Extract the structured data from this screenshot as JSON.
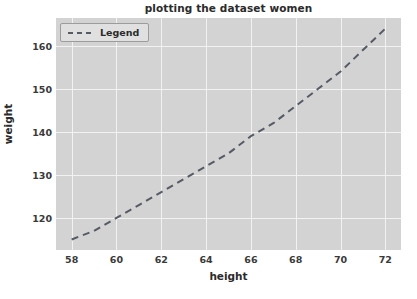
{
  "chart_data": {
    "type": "line",
    "title": "plotting the dataset women",
    "xlabel": "height",
    "ylabel": "weight",
    "x": [
      58,
      59,
      60,
      61,
      62,
      63,
      64,
      65,
      66,
      67,
      68,
      69,
      70,
      71,
      72
    ],
    "series": [
      {
        "name": "Legend",
        "values": [
          115,
          117,
          120,
          123,
          126,
          129,
          132,
          135,
          139,
          142,
          146,
          150,
          154,
          159,
          164
        ],
        "linestyle": "dashed",
        "color": "#555a64",
        "linewidth": 2
      }
    ],
    "xlim": [
      57.3,
      72.7
    ],
    "ylim": [
      112.55,
      166.45
    ],
    "xticks": [
      58,
      60,
      62,
      64,
      66,
      68,
      70,
      72
    ],
    "yticks": [
      120,
      130,
      140,
      150,
      160
    ],
    "grid": true,
    "grid_color": "#f2f2f2",
    "plot_background": "#d3d3d3",
    "figure_background": "#ffffff",
    "legend": {
      "label": "Legend",
      "position": "upper left",
      "background": "#e0e0e0",
      "border_color": "#9c9c9c"
    }
  }
}
